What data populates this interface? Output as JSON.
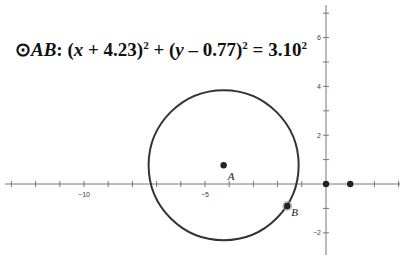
{
  "equation": {
    "symbol": "⊙",
    "name": "AB",
    "colon": ":",
    "part1_open": "(",
    "var_x": "x",
    "part1_rest": " + 4.23)",
    "exp1": "2",
    "plus": " + (",
    "var_y": "y",
    "part2_rest": " – 0.77)",
    "exp2": "2",
    "equals": " = 3.10",
    "exp3": "2"
  },
  "axes": {
    "x_tick_labels": [
      {
        "value": "-10",
        "x": -10
      },
      {
        "value": "-5",
        "x": -5
      }
    ],
    "y_tick_labels": [
      {
        "value": "6",
        "y": 6
      },
      {
        "value": "4",
        "y": 4
      },
      {
        "value": "2",
        "y": 2
      },
      {
        "value": "-2",
        "y": -2
      }
    ]
  },
  "circle": {
    "center": {
      "x": -4.23,
      "y": 0.77
    },
    "radius": 3.1
  },
  "points": [
    {
      "label": "A",
      "x": -4.23,
      "y": 0.77
    },
    {
      "label": "B",
      "x": -1.6,
      "y": -0.9
    },
    {
      "label": "",
      "x": 0,
      "y": 0
    },
    {
      "label": "",
      "x": 1,
      "y": 0
    }
  ],
  "faded_text": {
    "top": "…",
    "bottom": "…"
  }
}
